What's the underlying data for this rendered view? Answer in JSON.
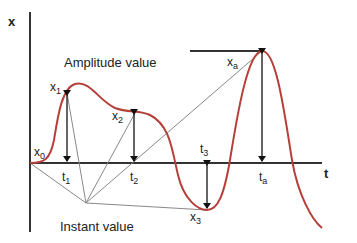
{
  "diagram": {
    "axes": {
      "y_label": "x",
      "x_label": "t"
    },
    "annotations": {
      "amplitude": "Amplitude value",
      "instant": "Instant value"
    },
    "points": {
      "x0": {
        "main": "x",
        "sub": "0"
      },
      "x1": {
        "main": "x",
        "sub": "1"
      },
      "x2": {
        "main": "x",
        "sub": "2"
      },
      "x3": {
        "main": "x",
        "sub": "3"
      },
      "xa": {
        "main": "x",
        "sub": "a"
      }
    },
    "times": {
      "t1": {
        "main": "t",
        "sub": "1"
      },
      "t2": {
        "main": "t",
        "sub": "2"
      },
      "t3": {
        "main": "t",
        "sub": "3"
      },
      "ta": {
        "main": "t",
        "sub": "a"
      }
    },
    "colors": {
      "curve": "#b5403a",
      "axis": "#333333",
      "guide": "#888888"
    }
  }
}
